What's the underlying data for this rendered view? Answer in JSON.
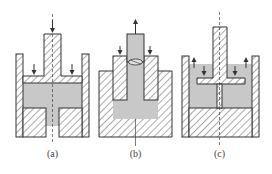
{
  "figure": {
    "type": "mechanical cross-section diagrams",
    "panels": [
      {
        "id": "a",
        "label": "(a)",
        "description": "Hollow punch with flange pressing down into cylinder; fluid region between flange and split bottom die; center axis dashed; downward arrows on top of punch and flange"
      },
      {
        "id": "b",
        "label": "(b)",
        "description": "Plain ram extruding upward through hatched sleeve inserted into container; fluid below sleeve; upward arrow on ram; downward arrows on sleeve shoulders"
      },
      {
        "id": "c",
        "label": "(c)",
        "description": "T-shaped hollow punch pressing into fluid-filled cylinder with solid base; upward arrows along walls; downward arrows on flange"
      }
    ],
    "colors": {
      "fluid": "#c8c8c8",
      "stroke": "#333333",
      "background": "#ffffff"
    }
  }
}
